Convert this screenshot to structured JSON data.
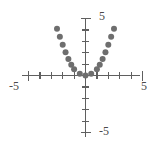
{
  "chart_data": {
    "type": "scatter",
    "title": "",
    "subtitle": "",
    "xlabel": "",
    "ylabel": "",
    "xlim": [
      -5,
      5
    ],
    "ylim": [
      -5,
      5
    ],
    "grid": false,
    "legend": null,
    "legend_position": "none",
    "x_ticks": [
      -5,
      -4,
      -3,
      -2,
      -1,
      0,
      1,
      2,
      3,
      4,
      5
    ],
    "y_ticks": [
      -5,
      -4,
      -3,
      -2,
      -1,
      0,
      1,
      2,
      3,
      4,
      5
    ],
    "x_tick_labels": [
      "-5",
      "",
      "",
      "",
      "",
      "",
      "",
      "",
      "",
      "",
      "5"
    ],
    "y_tick_labels": [
      "-5",
      "",
      "",
      "",
      "",
      "",
      "",
      "",
      "",
      "",
      "5"
    ],
    "point_color": "#6e6e6e",
    "axis_color": "#5f5f5f",
    "marker": "circle",
    "marker_size": 5,
    "series": [
      {
        "name": "points",
        "x": [
          -2.5,
          -2.25,
          -2.0,
          -1.75,
          -1.5,
          -1.25,
          -1.0,
          -0.5,
          0.0,
          0.5,
          1.0,
          1.25,
          1.5,
          1.75,
          2.0,
          2.25,
          2.5
        ],
        "y": [
          4.1,
          3.4,
          2.7,
          2.05,
          1.45,
          0.95,
          0.55,
          0.15,
          0.0,
          0.15,
          0.55,
          0.95,
          1.45,
          2.05,
          2.7,
          3.4,
          4.1
        ]
      }
    ],
    "axis_end_labels": {
      "y_top": "5",
      "y_bottom": "-5",
      "x_right": "5",
      "x_left": "-5"
    }
  },
  "figure": {
    "name": "parabola-scatter-plot",
    "background": "#ffffff"
  }
}
